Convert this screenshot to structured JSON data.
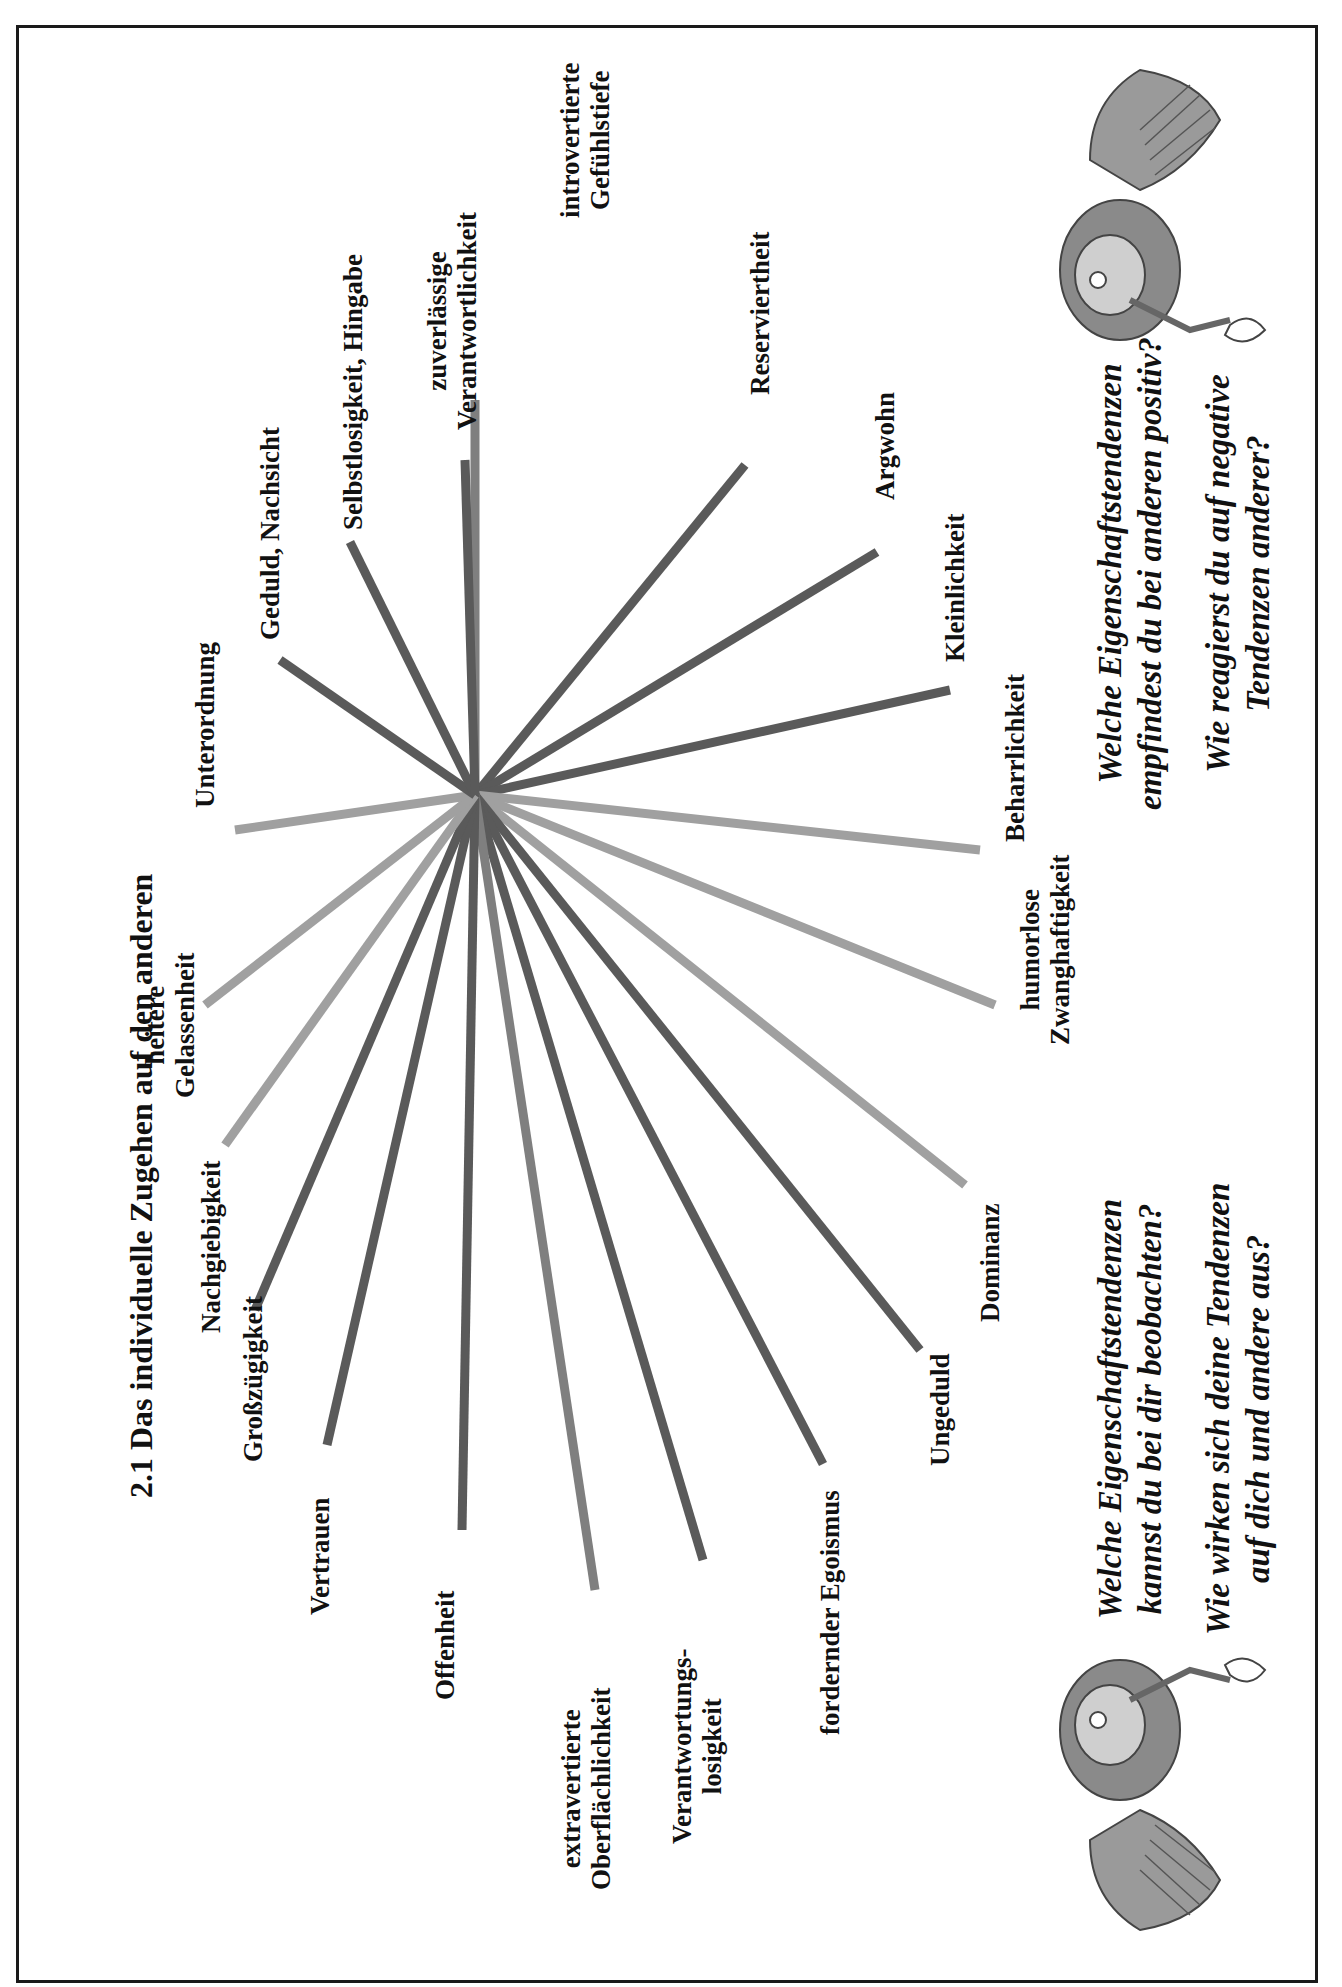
{
  "page": {
    "title": "2.1  Das individuelle Zugehen auf den anderen"
  },
  "diagram": {
    "center": [
      475,
      795
    ],
    "colors": {
      "dark": "#5a5a5a",
      "mid": "#7f7f7f",
      "light": "#a0a0a0"
    },
    "spokes": [
      {
        "label": "introvertierte Gefühlstiefe",
        "end": [
          475,
          400
        ],
        "tone": "mid"
      },
      {
        "label": "Reserviertheit",
        "end": [
          745,
          465
        ],
        "tone": "dark"
      },
      {
        "label": "Argwohn",
        "end": [
          877,
          552
        ],
        "tone": "dark"
      },
      {
        "label": "Kleinlichkeit",
        "end": [
          950,
          690
        ],
        "tone": "dark"
      },
      {
        "label": "Beharrlichkeit",
        "end": [
          980,
          850
        ],
        "tone": "light"
      },
      {
        "label": "humorlose Zwanghaftigkeit",
        "end": [
          995,
          1005
        ],
        "tone": "light"
      },
      {
        "label": "Dominanz",
        "end": [
          965,
          1185
        ],
        "tone": "light"
      },
      {
        "label": "Ungeduld",
        "end": [
          920,
          1350
        ],
        "tone": "dark"
      },
      {
        "label": "fordernder Egoismus",
        "end": [
          823,
          1464
        ],
        "tone": "dark"
      },
      {
        "label": "Verantwortungs-losigkeit",
        "end": [
          703,
          1560
        ],
        "tone": "dark"
      },
      {
        "label": "extravertierte Oberflächlichkeit",
        "end": [
          595,
          1590
        ],
        "tone": "mid"
      },
      {
        "label": "Offenheit",
        "end": [
          462,
          1530
        ],
        "tone": "dark"
      },
      {
        "label": "Vertrauen",
        "end": [
          327,
          1445
        ],
        "tone": "dark"
      },
      {
        "label": "Großzügigkeit",
        "end": [
          255,
          1310
        ],
        "tone": "dark"
      },
      {
        "label": "Nachgiebigkeit",
        "end": [
          225,
          1145
        ],
        "tone": "light"
      },
      {
        "label": "heitere Gelassenheit",
        "end": [
          205,
          1005
        ],
        "tone": "light"
      },
      {
        "label": "Unterordnung",
        "end": [
          235,
          830
        ],
        "tone": "light"
      },
      {
        "label": "Geduld, Nachsicht",
        "end": [
          280,
          660
        ],
        "tone": "dark"
      },
      {
        "label": "Selbstlosigkeit, Hingabe",
        "end": [
          350,
          542
        ],
        "tone": "dark"
      },
      {
        "label": "zuverlässige Verantwortlichkeit",
        "end": [
          465,
          460
        ],
        "tone": "dark"
      }
    ],
    "labels": {
      "introvertiert_1": "introvertierte",
      "introvertiert_2": "Gefühlstiefe",
      "reserviertheit": "Reserviertheit",
      "argwohn": "Argwohn",
      "kleinlichkeit": "Kleinlichkeit",
      "beharrlichkeit": "Beharrlichkeit",
      "humorlose_1": "humorlose",
      "humorlose_2": "Zwanghaftigkeit",
      "dominanz": "Dominanz",
      "ungeduld": "Ungeduld",
      "egoismus": "fordernder Egoismus",
      "verantwortungslos_1": "Verantwortungs-",
      "verantwortungslos_2": "losigkeit",
      "extravertiert_1": "extravertierte",
      "extravertiert_2": "Oberflächlichkeit",
      "offenheit": "Offenheit",
      "vertrauen": "Vertrauen",
      "grosszuegigkeit": "Großzügigkeit",
      "nachgiebigkeit": "Nachgiebigkeit",
      "heitere_1": "heitere",
      "heitere_2": "Gelassenheit",
      "unterordnung": "Unterordnung",
      "geduld": "Geduld, Nachsicht",
      "selbstlosigkeit": "Selbstlosigkeit, Hingabe",
      "zuverlaessig_1": "zuverlässige",
      "zuverlaessig_2": "Verantwortlichkeit"
    }
  },
  "questions": {
    "left": {
      "q1_line1": "Welche Eigenschaftstendenzen",
      "q1_line2": "kannst du bei dir beobachten?",
      "q2_line1": "Wie wirken sich deine Tendenzen",
      "q2_line2": "auf dich und andere aus?"
    },
    "right": {
      "q1_line1": "Welche Eigenschaftstendenzen",
      "q1_line2": "empfindest du bei anderen positiv?",
      "q2_line1": "Wie reagierst du auf negative",
      "q2_line2": "Tendenzen anderer?"
    }
  },
  "illustrations": {
    "left": "gardener-with-butterfly-illustration",
    "right": "gardener-with-butterfly-illustration"
  }
}
